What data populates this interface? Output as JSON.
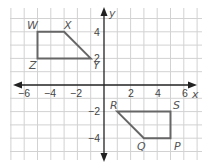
{
  "diagram": {
    "type": "coordinate-plane",
    "axes": {
      "x_label": "x",
      "y_label": "y",
      "x_ticks": [
        {
          "value": -6,
          "label": "−6"
        },
        {
          "value": -4,
          "label": "−4"
        },
        {
          "value": -2,
          "label": "−2"
        },
        {
          "value": 2,
          "label": "2"
        },
        {
          "value": 4,
          "label": "4"
        },
        {
          "value": 6,
          "label": "6"
        }
      ],
      "y_ticks": [
        {
          "value": 4,
          "label": "4"
        },
        {
          "value": 2,
          "label": "2"
        },
        {
          "value": -2,
          "label": "−2"
        },
        {
          "value": -4,
          "label": "−4"
        }
      ]
    },
    "shapes": [
      {
        "name": "WXYZ",
        "vertices": [
          {
            "label": "W",
            "x": -5,
            "y": 4
          },
          {
            "label": "X",
            "x": -3,
            "y": 4
          },
          {
            "label": "Y",
            "x": -1,
            "y": 2
          },
          {
            "label": "Z",
            "x": -5,
            "y": 2
          }
        ]
      },
      {
        "name": "RSPQ",
        "vertices": [
          {
            "label": "R",
            "x": 1,
            "y": -2
          },
          {
            "label": "S",
            "x": 5,
            "y": -2
          },
          {
            "label": "P",
            "x": 5,
            "y": -4
          },
          {
            "label": "Q",
            "x": 3,
            "y": -4
          }
        ]
      }
    ],
    "colors": {
      "grid": "#cfcfcf",
      "axis": "#222222",
      "shape_stroke": "#666666"
    }
  }
}
